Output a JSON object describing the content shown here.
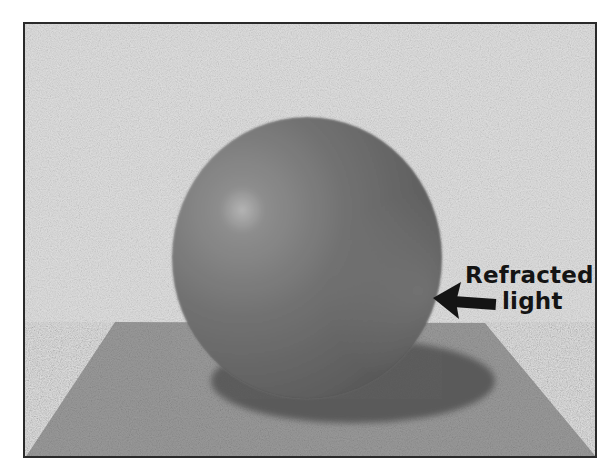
{
  "figure": {
    "annotation": {
      "line1": "Refracted",
      "line2": "light",
      "arrow_direction": "left"
    },
    "colors": {
      "background": "#dcdcdc",
      "floor": "#9a9a9a",
      "sphere_mid": "#7a7a7a",
      "sphere_highlight": "#bcbcbc",
      "sphere_dark": "#555555",
      "shadow": "#5e5e5e",
      "frame": "#2a2a2a",
      "text": "#141414"
    }
  }
}
